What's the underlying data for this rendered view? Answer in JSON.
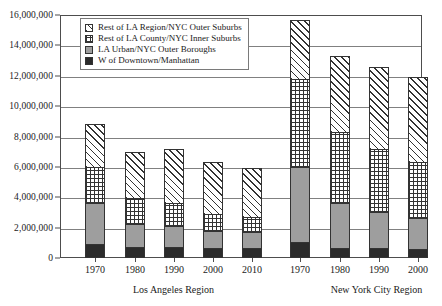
{
  "chart_data": {
    "type": "bar",
    "stacked": true,
    "title": "",
    "subtitle": "",
    "xlabel": "",
    "ylabel": "",
    "ylim": [
      0,
      16000000
    ],
    "ytick_step": 2000000,
    "grid": true,
    "legend_position": "top-left-inside",
    "ytick_labels": [
      "0",
      "2,000,000",
      "4,000,000",
      "6,000,000",
      "8,000,000",
      "10,000,000",
      "12,000,000",
      "14,000,000",
      "16,000,000"
    ],
    "ytick_values": [
      0,
      2000000,
      4000000,
      6000000,
      8000000,
      10000000,
      12000000,
      14000000,
      16000000
    ],
    "legend": [
      {
        "label": "Rest of LA Region/NYC Outer Suburbs",
        "pattern": "diagonal-hatch"
      },
      {
        "label": "Rest of LA County/NYC Inner Suburbs",
        "pattern": "cross-hatch"
      },
      {
        "label": "LA Urban/NYC Outer Boroughs",
        "pattern": "solid-gray",
        "color": "#9e9e9e"
      },
      {
        "label": "W of Downtown/Manhattan",
        "pattern": "solid-black",
        "color": "#2b2b2b"
      }
    ],
    "series": [
      {
        "name": "W of Downtown/Manhattan",
        "pattern": "solid-black",
        "values": [
          950000,
          720000,
          730000,
          640000,
          680000,
          1050000,
          650000,
          680000,
          610000,
          670000
        ]
      },
      {
        "name": "LA Urban/NYC Outer Boroughs",
        "pattern": "solid-gray",
        "values": [
          2650000,
          1530000,
          1350000,
          1140000,
          1060000,
          4950000,
          3000000,
          2340000,
          2030000,
          1930000
        ]
      },
      {
        "name": "Rest of LA County/NYC Inner Suburbs",
        "pattern": "cross-hatch",
        "values": [
          2400000,
          1700000,
          1520000,
          1150000,
          950000,
          5800000,
          4650000,
          4180000,
          3650000,
          3200000
        ]
      },
      {
        "name": "Rest of LA Region/NYC Outer Suburbs",
        "pattern": "diagonal-hatch",
        "values": [
          2800000,
          3030000,
          3580000,
          3370000,
          3260000,
          3900000,
          5000000,
          5400000,
          5660000,
          5500000
        ]
      }
    ],
    "groups": [
      {
        "label": "Los Angeles Region",
        "categories": [
          "1970",
          "1980",
          "1990",
          "2000",
          "2010"
        ],
        "bars": [
          {
            "category": "1970",
            "segments": [
              950000,
              2650000,
              2400000,
              2800000
            ],
            "total": 8800000
          },
          {
            "category": "1980",
            "segments": [
              720000,
              1530000,
              1700000,
              3030000
            ],
            "total": 6980000
          },
          {
            "category": "1990",
            "segments": [
              730000,
              1350000,
              1520000,
              3580000
            ],
            "total": 7180000
          },
          {
            "category": "2000",
            "segments": [
              640000,
              1140000,
              1150000,
              3370000
            ],
            "total": 6300000
          },
          {
            "category": "2010",
            "segments": [
              680000,
              1060000,
              950000,
              3260000
            ],
            "total": 5950000
          }
        ]
      },
      {
        "label": "New York City Region",
        "categories": [
          "1970",
          "1980",
          "1990",
          "2000",
          "2010"
        ],
        "bars": [
          {
            "category": "1970",
            "segments": [
              1050000,
              4950000,
              5800000,
              3900000
            ],
            "total": 15700000
          },
          {
            "category": "1980",
            "segments": [
              650000,
              3000000,
              4650000,
              5000000
            ],
            "total": 13300000
          },
          {
            "category": "1990",
            "segments": [
              680000,
              2340000,
              4180000,
              5400000
            ],
            "total": 12600000
          },
          {
            "category": "2000",
            "segments": [
              610000,
              2030000,
              3650000,
              5660000
            ],
            "total": 11950000
          },
          {
            "category": "2010",
            "segments": [
              670000,
              1930000,
              3200000,
              5500000
            ],
            "total": 11300000
          }
        ]
      }
    ]
  }
}
